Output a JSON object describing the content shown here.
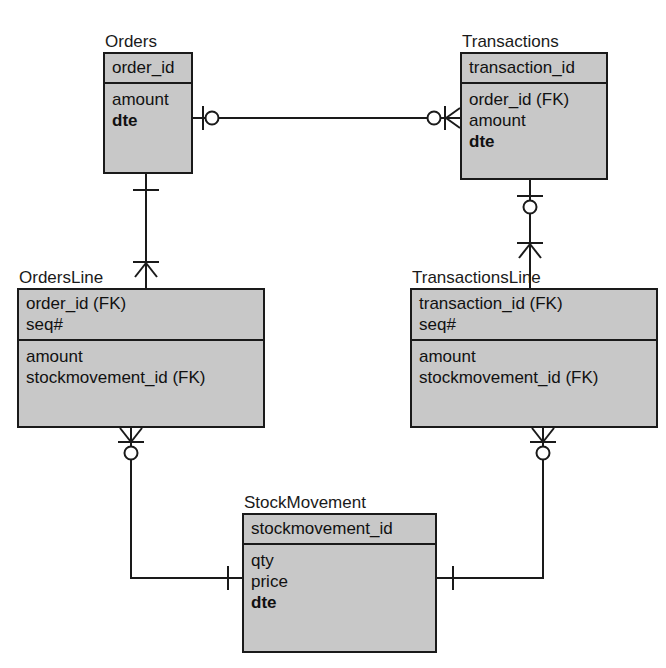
{
  "diagram": {
    "notation": "crows-foot",
    "background_color": "#ffffff",
    "entity_fill_color": "#c8c8c8",
    "line_color": "#1a1a1a"
  },
  "entities": [
    {
      "id": "orders",
      "name": "Orders",
      "x": 103,
      "y": 52,
      "width": 90,
      "height": 122,
      "key_fields": [
        "order_id"
      ],
      "attr_fields": [
        "amount",
        "dte"
      ],
      "bold_fields": [
        "dte"
      ]
    },
    {
      "id": "transactions",
      "name": "Transactions",
      "x": 460,
      "y": 52,
      "width": 148,
      "height": 128,
      "key_fields": [
        "transaction_id"
      ],
      "attr_fields": [
        "order_id (FK)",
        "amount",
        "dte"
      ],
      "bold_fields": [
        "dte"
      ]
    },
    {
      "id": "ordersline",
      "name": "OrdersLine",
      "x": 17,
      "y": 288,
      "width": 248,
      "height": 140,
      "key_fields": [
        "order_id (FK)",
        "seq#"
      ],
      "attr_fields": [
        "amount",
        "stockmovement_id (FK)"
      ],
      "bold_fields": []
    },
    {
      "id": "transactionsline",
      "name": "TransactionsLine",
      "x": 410,
      "y": 288,
      "width": 248,
      "height": 140,
      "key_fields": [
        "transaction_id (FK)",
        "seq#"
      ],
      "attr_fields": [
        "amount",
        "stockmovement_id (FK)"
      ],
      "bold_fields": []
    },
    {
      "id": "stockmovement",
      "name": "StockMovement",
      "x": 242,
      "y": 513,
      "width": 195,
      "height": 140,
      "key_fields": [
        "stockmovement_id"
      ],
      "attr_fields": [
        "qty",
        "price",
        "dte"
      ],
      "bold_fields": [
        "dte"
      ]
    }
  ],
  "relationships": [
    {
      "id": "orders-transactions",
      "from_entity": "Orders",
      "to_entity": "Transactions",
      "from_cardinality": "one-or-zero",
      "to_cardinality": "zero-or-many",
      "label": ""
    },
    {
      "id": "orders-ordersline",
      "from_entity": "Orders",
      "to_entity": "OrdersLine",
      "from_cardinality": "one",
      "to_cardinality": "one-or-many",
      "label": ""
    },
    {
      "id": "transactions-transactionsline",
      "from_entity": "Transactions",
      "to_entity": "TransactionsLine",
      "from_cardinality": "zero-or-one",
      "to_cardinality": "one-or-many",
      "label": ""
    },
    {
      "id": "ordersline-stockmovement",
      "from_entity": "OrdersLine",
      "to_entity": "StockMovement",
      "from_cardinality": "zero-or-many",
      "to_cardinality": "one",
      "label": ""
    },
    {
      "id": "transactionsline-stockmovement",
      "from_entity": "TransactionsLine",
      "to_entity": "StockMovement",
      "from_cardinality": "zero-or-many",
      "to_cardinality": "one",
      "label": ""
    }
  ]
}
